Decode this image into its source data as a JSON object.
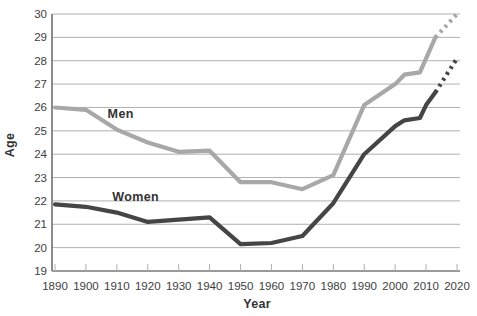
{
  "colors": {
    "men_line": "#a8a8a8",
    "women_line": "#454545",
    "gridline": "#b0b0b0",
    "axis": "#787878",
    "tick_text": "#3d3d3d",
    "label_text": "#333333",
    "background": "#ffffff"
  },
  "chart_data": {
    "type": "line",
    "title": "",
    "xlabel": "Year",
    "ylabel": "Age",
    "xlim": [
      1890,
      2020
    ],
    "ylim": [
      19,
      30
    ],
    "x_ticks": [
      1890,
      1900,
      1910,
      1920,
      1930,
      1940,
      1950,
      1960,
      1970,
      1980,
      1990,
      2000,
      2010,
      2020
    ],
    "y_ticks": [
      19,
      20,
      21,
      22,
      23,
      24,
      25,
      26,
      27,
      28,
      29,
      30
    ],
    "grid": true,
    "legend": "inline-labels",
    "series": [
      {
        "name": "Men",
        "style": "solid",
        "color_key": "men_line",
        "points": [
          [
            1890,
            26.0
          ],
          [
            1900,
            25.9
          ],
          [
            1910,
            25.05
          ],
          [
            1920,
            24.5
          ],
          [
            1930,
            24.1
          ],
          [
            1940,
            24.15
          ],
          [
            1950,
            22.8
          ],
          [
            1960,
            22.8
          ],
          [
            1970,
            22.5
          ],
          [
            1980,
            23.1
          ],
          [
            1990,
            26.1
          ],
          [
            2000,
            27.0
          ],
          [
            2003,
            27.4
          ],
          [
            2008,
            27.5
          ],
          [
            2013,
            29.0
          ]
        ],
        "label": {
          "text": "Men",
          "x": 1907,
          "y": 25.7
        }
      },
      {
        "name": "Men projection",
        "style": "dashed",
        "color_key": "men_line",
        "points": [
          [
            2013,
            29.0
          ],
          [
            2020,
            30.0
          ]
        ]
      },
      {
        "name": "Women",
        "style": "solid",
        "color_key": "women_line",
        "points": [
          [
            1890,
            21.85
          ],
          [
            1900,
            21.75
          ],
          [
            1910,
            21.5
          ],
          [
            1920,
            21.1
          ],
          [
            1930,
            21.2
          ],
          [
            1940,
            21.3
          ],
          [
            1950,
            20.15
          ],
          [
            1960,
            20.2
          ],
          [
            1970,
            20.5
          ],
          [
            1980,
            21.9
          ],
          [
            1990,
            24.0
          ],
          [
            2000,
            25.2
          ],
          [
            2003,
            25.45
          ],
          [
            2008,
            25.55
          ],
          [
            2010,
            26.1
          ],
          [
            2013,
            26.65
          ]
        ],
        "label": {
          "text": "Women",
          "x": 1908.5,
          "y": 22.15
        }
      },
      {
        "name": "Women projection",
        "style": "dashed",
        "color_key": "women_line",
        "points": [
          [
            2013,
            26.65
          ],
          [
            2020,
            28.1
          ]
        ]
      }
    ]
  }
}
